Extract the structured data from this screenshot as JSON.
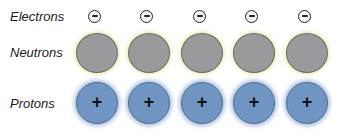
{
  "labels": {
    "electrons": "Electrons",
    "neutrons": "Neutrons",
    "protons": "Protons"
  },
  "particle_count_per_row": 5,
  "symbols": {
    "electron": "−",
    "proton": "+"
  },
  "colors": {
    "electron_fill": "#f4f4f4",
    "neutron_fill": "#9a9a9c",
    "neutron_glow": "#f2efb8",
    "proton_fill": "#7095c2",
    "proton_glow": "#a9bcd8"
  }
}
